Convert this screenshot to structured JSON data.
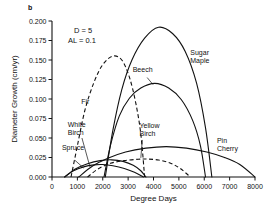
{
  "panel": {
    "label": "b"
  },
  "annotations": [
    {
      "name": "density-annotation",
      "text": "D = 5",
      "x": 74,
      "y": 33
    },
    {
      "name": "available-light-annotation",
      "text": "AL = 0.1",
      "x": 68,
      "y": 43
    }
  ],
  "axes": {
    "x": {
      "title": "Degree Days",
      "min": 0,
      "max": 8000,
      "step": 1000,
      "ticks": [
        "0",
        "1000",
        "2000",
        "3000",
        "4000",
        "5000",
        "6000",
        "7000",
        "8000"
      ]
    },
    "y": {
      "title": "Diameter Growth (cm/yr)",
      "min": 0.0,
      "max": 0.2,
      "step": 0.025,
      "ticks": [
        "0.000",
        "0.025",
        "0.050",
        "0.075",
        "0.100",
        "0.125",
        "0.150",
        "0.175",
        "0.200"
      ]
    }
  },
  "chart_data": {
    "type": "line",
    "title": "",
    "subtitle": "",
    "xlabel": "Degree Days",
    "ylabel": "Diameter Growth (cm/yr)",
    "xlim": [
      0,
      8000
    ],
    "ylim": [
      0.0,
      0.2
    ],
    "grid": false,
    "legend": "inline-curve-labels",
    "annotations": [
      "D = 5",
      "AL = 0.1",
      "b"
    ],
    "series": [
      {
        "name": "Fir",
        "style": "dashed",
        "label": "Fir",
        "label_x": 1150,
        "label_y": 0.0935,
        "peak": {
          "x": 2400,
          "y": 0.155
        },
        "x_start": 750,
        "x_end": 3650,
        "points": [
          {
            "x": 750,
            "y": 0.0
          },
          {
            "x": 1000,
            "y": 0.04
          },
          {
            "x": 1300,
            "y": 0.086
          },
          {
            "x": 1650,
            "y": 0.121
          },
          {
            "x": 2000,
            "y": 0.144
          },
          {
            "x": 2400,
            "y": 0.155
          },
          {
            "x": 2750,
            "y": 0.15
          },
          {
            "x": 3050,
            "y": 0.128
          },
          {
            "x": 3300,
            "y": 0.095
          },
          {
            "x": 3500,
            "y": 0.055
          },
          {
            "x": 3650,
            "y": 0.0
          }
        ]
      },
      {
        "name": "White Birch",
        "style": "solid",
        "label": "White Birch",
        "label_x": 620,
        "label_y": 0.0645,
        "peak": {
          "x": 2350,
          "y": 0.022
        },
        "x_start": 500,
        "x_end": 3700,
        "points": [
          {
            "x": 500,
            "y": 0.0
          },
          {
            "x": 900,
            "y": 0.01
          },
          {
            "x": 1400,
            "y": 0.017
          },
          {
            "x": 1900,
            "y": 0.021
          },
          {
            "x": 2350,
            "y": 0.022
          },
          {
            "x": 2800,
            "y": 0.02
          },
          {
            "x": 3200,
            "y": 0.015
          },
          {
            "x": 3500,
            "y": 0.008
          },
          {
            "x": 3700,
            "y": 0.0
          }
        ]
      },
      {
        "name": "Spruce",
        "style": "solid",
        "label": "Spruce",
        "label_x": 390,
        "label_y": 0.0345,
        "peak": {
          "x": 2000,
          "y": 0.016
        },
        "x_start": 500,
        "x_end": 3600,
        "points": [
          {
            "x": 500,
            "y": 0.0
          },
          {
            "x": 850,
            "y": 0.008
          },
          {
            "x": 1250,
            "y": 0.013
          },
          {
            "x": 1650,
            "y": 0.0155
          },
          {
            "x": 2000,
            "y": 0.016
          },
          {
            "x": 2400,
            "y": 0.0145
          },
          {
            "x": 2850,
            "y": 0.011
          },
          {
            "x": 3250,
            "y": 0.006
          },
          {
            "x": 3600,
            "y": 0.0
          }
        ]
      },
      {
        "name": "Beech",
        "style": "solid",
        "label": "Beech",
        "label_x": 3180,
        "label_y": 0.1345,
        "peak": {
          "x": 4050,
          "y": 0.12
        },
        "x_start": 2050,
        "x_end": 6050,
        "points": [
          {
            "x": 2050,
            "y": 0.0
          },
          {
            "x": 2300,
            "y": 0.04
          },
          {
            "x": 2650,
            "y": 0.078
          },
          {
            "x": 3050,
            "y": 0.101
          },
          {
            "x": 3500,
            "y": 0.114
          },
          {
            "x": 4050,
            "y": 0.12
          },
          {
            "x": 4600,
            "y": 0.114
          },
          {
            "x": 5100,
            "y": 0.099
          },
          {
            "x": 5550,
            "y": 0.072
          },
          {
            "x": 5850,
            "y": 0.04
          },
          {
            "x": 6050,
            "y": 0.0
          }
        ]
      },
      {
        "name": "Sugar Maple",
        "style": "solid",
        "label": "Sugar Maple",
        "label_x": 5450,
        "label_y": 0.1565,
        "peak": {
          "x": 4200,
          "y": 0.192
        },
        "x_start": 2100,
        "x_end": 6300,
        "points": [
          {
            "x": 2100,
            "y": 0.0
          },
          {
            "x": 2400,
            "y": 0.06
          },
          {
            "x": 2750,
            "y": 0.112
          },
          {
            "x": 3150,
            "y": 0.15
          },
          {
            "x": 3650,
            "y": 0.178
          },
          {
            "x": 4200,
            "y": 0.192
          },
          {
            "x": 4750,
            "y": 0.184
          },
          {
            "x": 5250,
            "y": 0.161
          },
          {
            "x": 5700,
            "y": 0.12
          },
          {
            "x": 6050,
            "y": 0.063
          },
          {
            "x": 6300,
            "y": 0.0
          }
        ]
      },
      {
        "name": "Yellow Birch",
        "style": "dashed",
        "label": "Yellow Birch",
        "label_x": 3450,
        "label_y": 0.0625,
        "peak": {
          "x": 3750,
          "y": 0.023
        },
        "x_start": 1400,
        "x_end": 5450,
        "points": [
          {
            "x": 1400,
            "y": 0.0
          },
          {
            "x": 1800,
            "y": 0.01
          },
          {
            "x": 2300,
            "y": 0.0175
          },
          {
            "x": 2850,
            "y": 0.021
          },
          {
            "x": 3400,
            "y": 0.0228
          },
          {
            "x": 3750,
            "y": 0.023
          },
          {
            "x": 4200,
            "y": 0.0218
          },
          {
            "x": 4650,
            "y": 0.018
          },
          {
            "x": 5050,
            "y": 0.011
          },
          {
            "x": 5450,
            "y": 0.0
          }
        ]
      },
      {
        "name": "Pin Cherry",
        "style": "solid",
        "label": "Pin Cherry",
        "label_x": 6500,
        "label_y": 0.0435,
        "peak": {
          "x": 4500,
          "y": 0.039
        },
        "x_start": 1050,
        "x_end": 8000,
        "points": [
          {
            "x": 1050,
            "y": 0.0
          },
          {
            "x": 1600,
            "y": 0.014
          },
          {
            "x": 2200,
            "y": 0.024
          },
          {
            "x": 2900,
            "y": 0.032
          },
          {
            "x": 3700,
            "y": 0.037
          },
          {
            "x": 4500,
            "y": 0.039
          },
          {
            "x": 5300,
            "y": 0.037
          },
          {
            "x": 6100,
            "y": 0.032
          },
          {
            "x": 6800,
            "y": 0.025
          },
          {
            "x": 7400,
            "y": 0.016
          },
          {
            "x": 8000,
            "y": 0.0
          }
        ]
      }
    ]
  }
}
